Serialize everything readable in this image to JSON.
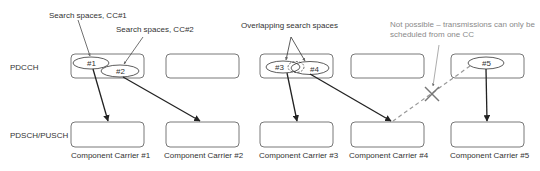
{
  "diagram": {
    "row_labels": {
      "pdcch": "PDCCH",
      "pdsch": "PDSCH/PUSCH"
    },
    "annotations": {
      "search_cc1": "Search spaces, CC#1",
      "search_cc2": "Search spaces, CC#2",
      "overlapping": "Overlapping search spaces",
      "not_possible_line1": "Not possible – transmissions can only be",
      "not_possible_line2": "scheduled from one CC"
    },
    "search_spaces": [
      "#1",
      "#2",
      "#3",
      "#4",
      "#5"
    ],
    "carriers": [
      {
        "label": "Component Carrier #1"
      },
      {
        "label": "Component Carrier #2"
      },
      {
        "label": "Component Carrier #3"
      },
      {
        "label": "Component Carrier #4"
      },
      {
        "label": "Component Carrier #5"
      }
    ],
    "colors": {
      "line": "#222222",
      "box_stroke": "#555555",
      "dashed": "#999999",
      "gray_text": "#8a8a8a"
    }
  }
}
